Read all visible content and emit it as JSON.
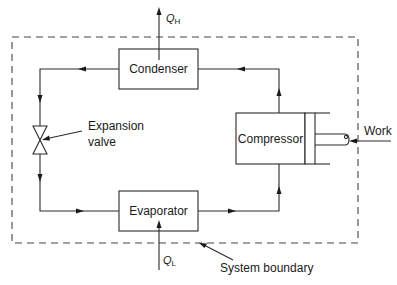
{
  "diagram": {
    "components": {
      "condenser": "Condenser",
      "evaporator": "Evaporator",
      "compressor": "Compressor",
      "expansion_valve_line1": "Expansion",
      "expansion_valve_line2": "valve"
    },
    "heat_flows": {
      "q_high": {
        "symbol": "Q",
        "subscript": "H"
      },
      "q_low": {
        "symbol": "Q",
        "subscript": "L"
      }
    },
    "inputs": {
      "work": "Work"
    },
    "annotations": {
      "system_boundary": "System boundary"
    },
    "flow_direction": [
      "Compressor",
      "Condenser",
      "Expansion valve",
      "Evaporator",
      "Compressor"
    ],
    "colors": {
      "line": "#2a2a2a",
      "boundary": "#444444",
      "background": "#ffffff"
    }
  }
}
